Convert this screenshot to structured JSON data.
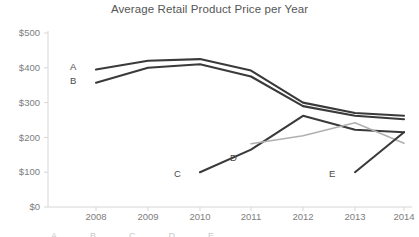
{
  "chart_data": {
    "type": "line",
    "title": "Average Retail Product Price per Year",
    "xlabel": "",
    "ylabel": "",
    "categories": [
      "2008",
      "2009",
      "2010",
      "2011",
      "2012",
      "2013",
      "2014"
    ],
    "x": [
      2008,
      2009,
      2010,
      2011,
      2012,
      2013,
      2014
    ],
    "ylim": [
      0,
      500
    ],
    "xlim": [
      2007.5,
      2014.3
    ],
    "ytick_labels": [
      "$0",
      "$100",
      "$200",
      "$300",
      "$400",
      "$500"
    ],
    "ytick_values": [
      0,
      100,
      200,
      300,
      400,
      500
    ],
    "grid": false,
    "legend_position": "bottom",
    "series": [
      {
        "name": "A",
        "color": "#3a3a3a",
        "x": [
          2008,
          2009,
          2010,
          2011,
          2012,
          2013,
          2014
        ],
        "values": [
          395,
          420,
          425,
          392,
          300,
          270,
          262
        ]
      },
      {
        "name": "B",
        "color": "#3a3a3a",
        "x": [
          2008,
          2009,
          2010,
          2011,
          2012,
          2013,
          2014
        ],
        "values": [
          357,
          400,
          410,
          375,
          290,
          262,
          252
        ]
      },
      {
        "name": "C",
        "color": "#3a3a3a",
        "x": [
          2010,
          2011,
          2012,
          2013,
          2014
        ],
        "values": [
          100,
          165,
          262,
          222,
          215
        ]
      },
      {
        "name": "D",
        "color": "#b0b0b0",
        "x": [
          2011,
          2012,
          2013,
          2014
        ],
        "values": [
          182,
          205,
          242,
          183
        ]
      },
      {
        "name": "E",
        "color": "#3a3a3a",
        "x": [
          2013,
          2014
        ],
        "values": [
          100,
          215
        ]
      }
    ],
    "series_label_anchors": [
      {
        "name": "A",
        "label": "A",
        "left": 70,
        "top": 61
      },
      {
        "name": "B",
        "label": "B",
        "left": 70,
        "top": 75
      },
      {
        "name": "C",
        "label": "C",
        "left": 174,
        "top": 168
      },
      {
        "name": "D",
        "label": "D",
        "left": 230,
        "top": 152
      },
      {
        "name": "E",
        "label": "E",
        "left": 329,
        "top": 168
      }
    ]
  },
  "axes": {
    "axis_color": "#d6d6d6",
    "y_labels": [
      {
        "text": "$500",
        "top": 27
      },
      {
        "text": "$400",
        "top": 62
      },
      {
        "text": "$300",
        "top": 97
      },
      {
        "text": "$200",
        "top": 132
      },
      {
        "text": "$100",
        "top": 166
      },
      {
        "text": "$0",
        "top": 201
      }
    ],
    "x_labels": [
      {
        "text": "2008",
        "left": 76
      },
      {
        "text": "2009",
        "left": 128
      },
      {
        "text": "2010",
        "left": 180
      },
      {
        "text": "2011",
        "left": 231
      },
      {
        "text": "2012",
        "left": 283
      },
      {
        "text": "2013",
        "left": 335
      },
      {
        "text": "2014",
        "left": 384
      }
    ]
  },
  "legend": {
    "clipped": true,
    "entries": [
      "A",
      "B",
      "C",
      "D",
      "E"
    ]
  }
}
